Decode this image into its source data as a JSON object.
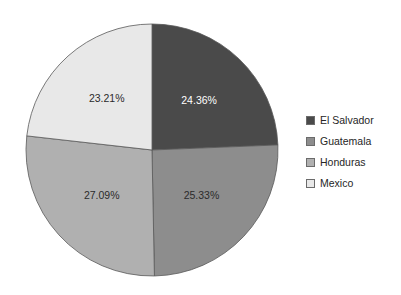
{
  "chart_data": {
    "type": "pie",
    "title": "",
    "labels": [
      "El Salvador",
      "Guatemala",
      "Honduras",
      "Mexico"
    ],
    "values": [
      24.36,
      25.33,
      27.09,
      23.21
    ],
    "value_labels": [
      "24.36%",
      "25.33%",
      "27.09%",
      "23.21%"
    ],
    "units": "percent",
    "total": 99.99,
    "start_angle_deg": 0,
    "direction": "clockwise",
    "legend_position": "right",
    "grid": false,
    "xlabel": "",
    "ylabel": "",
    "colors": [
      "#4a4a4a",
      "#8d8d8d",
      "#b0b0b0",
      "#e8e8e8"
    ],
    "slice_border_color": "#595959",
    "label_text_colors": [
      "#ffffff",
      "#2b2b2b",
      "#2b2b2b",
      "#2b2b2b"
    ]
  },
  "legend": {
    "items": [
      {
        "label": "El Salvador",
        "color": "#4a4a4a"
      },
      {
        "label": "Guatemala",
        "color": "#8d8d8d"
      },
      {
        "label": "Honduras",
        "color": "#b0b0b0"
      },
      {
        "label": "Mexico",
        "color": "#e8e8e8"
      }
    ]
  }
}
